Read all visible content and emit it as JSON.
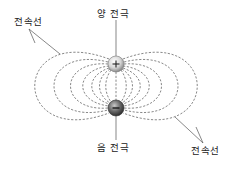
{
  "diagram": {
    "labels": {
      "positive_electrode": "양 전극",
      "negative_electrode": "음 전극",
      "field_lines_top_left": "전속선",
      "field_lines_bottom_right": "전속선"
    },
    "electrodes": {
      "positive": {
        "symbol": "+",
        "cx": 116,
        "cy": 64,
        "r": 8
      },
      "negative": {
        "symbol": "−",
        "cx": 116,
        "cy": 108,
        "r": 8
      }
    },
    "colors": {
      "field_line": "#6a6a6a",
      "positive_fill": "#e8e8e8",
      "negative_fill": "#6e6e6e",
      "text": "#222222"
    }
  }
}
